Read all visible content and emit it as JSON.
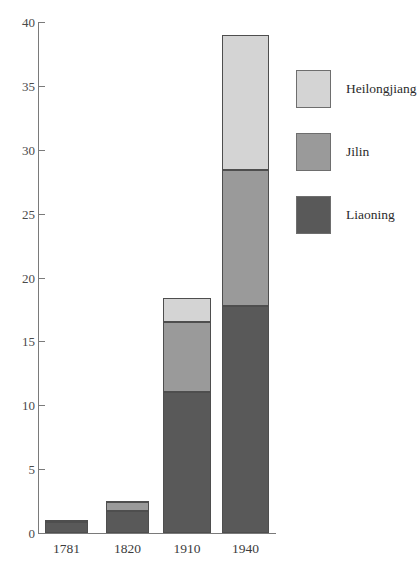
{
  "chart_data": {
    "type": "bar",
    "subtype": "stacked-bar",
    "title": "",
    "xlabel": "",
    "ylabel": "",
    "categories": [
      "1781",
      "1820",
      "1910",
      "1940"
    ],
    "series": [
      {
        "name": "Liaoning",
        "color": "#595959",
        "values": [
          0.9,
          1.7,
          11.0,
          17.8
        ]
      },
      {
        "name": "Jilin",
        "color": "#9a9a9a",
        "values": [
          0.05,
          0.7,
          5.5,
          10.6
        ]
      },
      {
        "name": "Heilongjiang",
        "color": "#d4d4d4",
        "values": [
          0.05,
          0.1,
          1.9,
          10.6
        ]
      }
    ],
    "totals": [
      1.0,
      2.5,
      18.4,
      39.0
    ],
    "ylim": [
      0,
      40
    ],
    "yticks": [
      0,
      5,
      10,
      15,
      20,
      25,
      30,
      35,
      40
    ],
    "ytick_labels": [
      "0",
      "5",
      "10",
      "15",
      "20",
      "25",
      "30",
      "35",
      "40"
    ],
    "grid": false,
    "legend_position": "right",
    "stack_order_bottom_to_top": [
      "Liaoning",
      "Jilin",
      "Heilongjiang"
    ]
  },
  "legend": {
    "entries": [
      {
        "label": "Heilongjiang",
        "color": "#d4d4d4"
      },
      {
        "label": "Jilin",
        "color": "#9a9a9a"
      },
      {
        "label": "Liaoning",
        "color": "#595959"
      }
    ]
  },
  "axes": {
    "y_tick_labels": [
      "40",
      "35",
      "30",
      "25",
      "20",
      "15",
      "10",
      "5",
      "0"
    ],
    "x_tick_labels": [
      "1781",
      "1820",
      "1910",
      "1940"
    ]
  },
  "colors": {
    "heilongjiang": "#d4d4d4",
    "jilin": "#9a9a9a",
    "liaoning": "#595959",
    "axis": "#7a7a7a",
    "bar_border": "#4e4e4e",
    "background": "#ffffff"
  }
}
